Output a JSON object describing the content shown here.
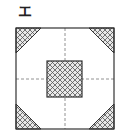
{
  "figure": {
    "label": "エ",
    "colors": {
      "stroke": "#333333",
      "hatch": "#555555",
      "dash": "#777777"
    }
  }
}
